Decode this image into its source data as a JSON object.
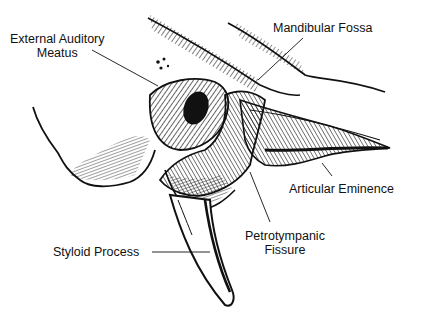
{
  "diagram": {
    "colors": {
      "ink": "#111111",
      "background": "#ffffff"
    },
    "labels": [
      {
        "id": "external-auditory-meatus",
        "lines": [
          "External Auditory",
          "Meatus"
        ]
      },
      {
        "id": "mandibular-fossa",
        "lines": [
          "Mandibular Fossa"
        ]
      },
      {
        "id": "articular-eminence",
        "lines": [
          "Articular Eminence"
        ]
      },
      {
        "id": "petrotympanic-fissure",
        "lines": [
          "Petrotympanic",
          "Fissure"
        ]
      },
      {
        "id": "styloid-process",
        "lines": [
          "Styloid Process"
        ]
      }
    ]
  }
}
